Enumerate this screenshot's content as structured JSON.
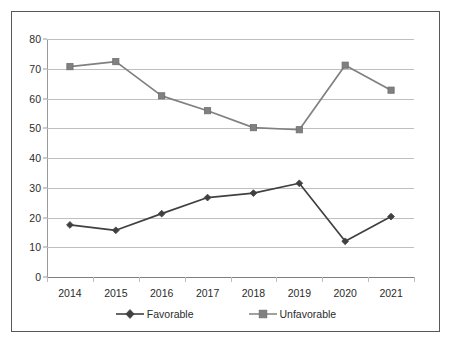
{
  "chart_data": {
    "type": "line",
    "title": "",
    "subtitle": "",
    "xlabel": "",
    "ylabel": "",
    "categories": [
      "2014",
      "2015",
      "2016",
      "2017",
      "2018",
      "2019",
      "2020",
      "2021"
    ],
    "series": [
      {
        "name": "Favorable",
        "color": "#404040",
        "marker": "diamond",
        "values": [
          17.5,
          15.7,
          21.3,
          26.7,
          28.2,
          31.5,
          12.0,
          20.3
        ]
      },
      {
        "name": "Unfavorable",
        "color": "#808080",
        "marker": "square",
        "values": [
          70.7,
          72.4,
          60.9,
          55.9,
          50.2,
          49.5,
          71.2,
          62.8
        ]
      }
    ],
    "ylim": [
      0,
      80
    ],
    "ytick_labels": [
      "0",
      "10",
      "20",
      "30",
      "40",
      "50",
      "60",
      "70",
      "80"
    ],
    "ytick_values": [
      0,
      10,
      20,
      30,
      40,
      50,
      60,
      70,
      80
    ],
    "grid": "horizontal",
    "legend_position": "bottom",
    "legend_entries": [
      "Favorable",
      "Unfavorable"
    ],
    "annotations": []
  },
  "frame": {
    "border_color": "#58585a",
    "background": "#ffffff"
  }
}
